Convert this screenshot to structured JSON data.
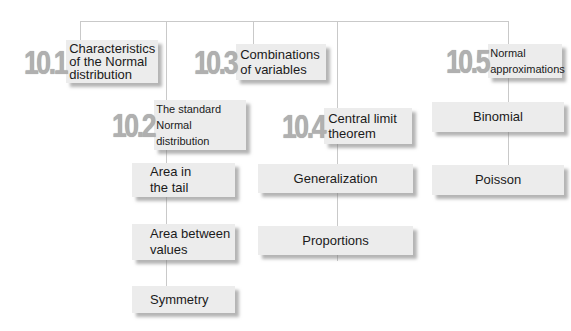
{
  "diagram": {
    "sections": [
      {
        "id": "10.1",
        "number": "10.1",
        "title_lines": [
          "Characteristics",
          "of the Normal",
          "distribution"
        ],
        "children": []
      },
      {
        "id": "10.2",
        "number": "10.2",
        "title_lines": [
          "The standard",
          "Normal distribution"
        ],
        "children": [
          {
            "lines": [
              "Area in",
              "the tail"
            ]
          },
          {
            "lines": [
              "Area between",
              "values"
            ]
          },
          {
            "lines": [
              "Symmetry"
            ]
          }
        ]
      },
      {
        "id": "10.3",
        "number": "10.3",
        "title_lines": [
          "Combinations",
          "of variables"
        ],
        "children": []
      },
      {
        "id": "10.4",
        "number": "10.4",
        "title_lines": [
          "Central limit",
          "theorem"
        ],
        "children": [
          {
            "lines": [
              "Generalization"
            ]
          },
          {
            "lines": [
              "Proportions"
            ]
          }
        ]
      },
      {
        "id": "10.5",
        "number": "10.5",
        "title_lines": [
          "Normal",
          "approximations"
        ],
        "children": [
          {
            "lines": [
              "Binomial"
            ]
          },
          {
            "lines": [
              "Poisson"
            ]
          }
        ]
      }
    ],
    "colors": {
      "box": "#ececec",
      "number": "#b0b0b0",
      "connector": "#c9c9c9"
    }
  }
}
